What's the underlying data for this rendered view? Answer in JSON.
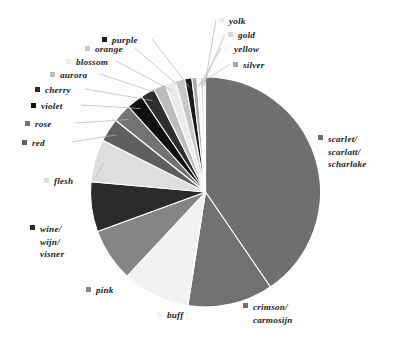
{
  "chart_data": {
    "type": "pie",
    "title": "",
    "subtitle": "",
    "xlabel": "",
    "ylabel": "",
    "legend_position": "callout-labels",
    "grid": false,
    "start_angle_deg": 0,
    "direction": "clockwise",
    "categories": [
      "scarlet/ scarlatt/ scharlake",
      "crimson/ carmosijn",
      "buff",
      "pink",
      "wine/ wijn/ visner",
      "flesh",
      "red",
      "rose",
      "violet",
      "cherry",
      "aurora",
      "blossom",
      "orange",
      "purple",
      "silver",
      "yellow",
      "gold",
      "yolk"
    ],
    "values": [
      40.5,
      12.0,
      9.5,
      7.5,
      7.0,
      6.0,
      3.3,
      2.6,
      2.3,
      2.0,
      1.7,
      1.5,
      1.3,
      1.0,
      0.7,
      0.5,
      0.4,
      0.3
    ],
    "unit": "percent",
    "slice_colors": [
      "#6f6f6f",
      "#717171",
      "#f2f2f2",
      "#858585",
      "#2a2a2a",
      "#dedede",
      "#5f5f5f",
      "#737373",
      "#101010",
      "#2e2e2e",
      "#bdbdbd",
      "#ebebeb",
      "#c9c9c9",
      "#1a1a1a",
      "#a8a8a8",
      "#f7f7f7",
      "#d6d6d6",
      "#efefef"
    ],
    "slice_edge_color": "#ffffff",
    "background_color": "#fdfdfd",
    "text_color": "#1c1c1c"
  },
  "labels": {
    "scarlet": {
      "line1": "scarlet/",
      "line2": "scarlatt/",
      "line3": "scharlake",
      "swatch": "#6f6f6f"
    },
    "crimson": {
      "line1": "crimson/",
      "line2": "carmosijn",
      "swatch": "#717171"
    },
    "buff": {
      "line1": "buff",
      "swatch": "#f2f2f2"
    },
    "pink": {
      "line1": "pink",
      "swatch": "#858585"
    },
    "wine": {
      "line1": "wine/",
      "line2": "wijn/",
      "line3": "visner",
      "swatch": "#2a2a2a"
    },
    "flesh": {
      "line1": "flesh",
      "swatch": "#dedede"
    },
    "red": {
      "line1": "red",
      "swatch": "#5f5f5f"
    },
    "rose": {
      "line1": "rose",
      "swatch": "#737373"
    },
    "violet": {
      "line1": "violet",
      "swatch": "#101010"
    },
    "cherry": {
      "line1": "cherry",
      "swatch": "#2e2e2e"
    },
    "aurora": {
      "line1": "aurora",
      "swatch": "#bdbdbd"
    },
    "blossom": {
      "line1": "blossom",
      "swatch": "#ebebeb"
    },
    "orange": {
      "line1": "orange",
      "swatch": "#c9c9c9"
    },
    "purple": {
      "line1": "purple",
      "swatch": "#1a1a1a"
    },
    "silver": {
      "line1": "silver",
      "swatch": "#a8a8a8"
    },
    "yellow": {
      "line1": "yellow",
      "swatch": "#f7f7f7"
    },
    "gold": {
      "line1": "gold",
      "swatch": "#d6d6d6"
    },
    "yolk": {
      "line1": "yolk",
      "swatch": "#efefef"
    }
  }
}
